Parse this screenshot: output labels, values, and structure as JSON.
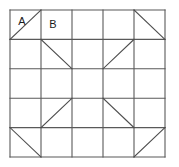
{
  "figure": {
    "type": "geometric-diagram",
    "background_color": "#ffffff",
    "line_color": "#595959",
    "diagonal_color": "#4d4d4d",
    "label_color": "#1a1a1a",
    "line_width": 1.1,
    "grid": {
      "rows": 5,
      "cols": 5,
      "x_left": 10,
      "y_top": 10,
      "x_right": 165,
      "y_bottom": 157,
      "x_lines": [
        10,
        41,
        72,
        103,
        134,
        165
      ],
      "y_lines": [
        10,
        39.4,
        68.8,
        98.2,
        127.6,
        157
      ]
    },
    "labels": [
      {
        "text": "A",
        "row": 0,
        "col": 0,
        "x": 22,
        "y": 22
      },
      {
        "text": "B",
        "row": 0,
        "col": 1,
        "x": 53,
        "y": 25
      }
    ],
    "diagonals": [
      {
        "id": "d-r0c0",
        "row": 0,
        "col": 0,
        "direction": "bottom-left-to-top-right",
        "x1": 10,
        "y1": 39.4,
        "x2": 41,
        "y2": 10
      },
      {
        "id": "d-r0c4",
        "row": 0,
        "col": 4,
        "direction": "top-left-to-bottom-right",
        "x1": 134,
        "y1": 10,
        "x2": 165,
        "y2": 39.4
      },
      {
        "id": "d-r1c1",
        "row": 1,
        "col": 1,
        "direction": "top-left-to-bottom-right",
        "x1": 41,
        "y1": 39.4,
        "x2": 72,
        "y2": 68.8
      },
      {
        "id": "d-r1c3",
        "row": 1,
        "col": 3,
        "direction": "bottom-left-to-top-right",
        "x1": 103,
        "y1": 68.8,
        "x2": 134,
        "y2": 39.4
      },
      {
        "id": "d-r3c1",
        "row": 3,
        "col": 1,
        "direction": "bottom-left-to-top-right",
        "x1": 41,
        "y1": 127.6,
        "x2": 72,
        "y2": 98.2
      },
      {
        "id": "d-r3c3",
        "row": 3,
        "col": 3,
        "direction": "top-left-to-bottom-right",
        "x1": 103,
        "y1": 98.2,
        "x2": 134,
        "y2": 127.6
      },
      {
        "id": "d-r4c0",
        "row": 4,
        "col": 0,
        "direction": "top-left-to-bottom-right",
        "x1": 10,
        "y1": 127.6,
        "x2": 41,
        "y2": 157
      },
      {
        "id": "d-r4c4",
        "row": 4,
        "col": 4,
        "direction": "bottom-left-to-top-right",
        "x1": 134,
        "y1": 157,
        "x2": 165,
        "y2": 127.6
      }
    ]
  }
}
